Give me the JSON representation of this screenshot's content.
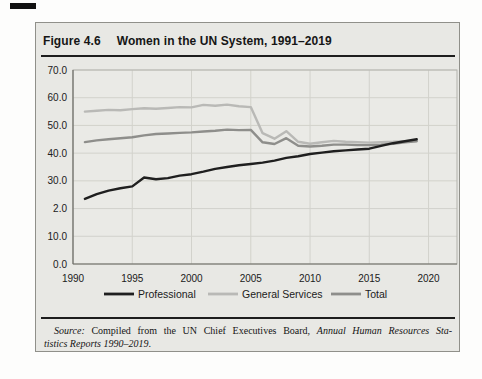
{
  "figure": {
    "label": "Figure 4.6",
    "title": "Women in the UN System, 1991–2019"
  },
  "source": {
    "label": "Source:",
    "text_after_label": " Compiled from the UN Chief Executives Board, ",
    "italic_line1": "Annual Human Resources Sta-",
    "italic_line2": "tistics Reports 1990–2019",
    "period": "."
  },
  "chart_data": {
    "type": "line",
    "x": [
      1991,
      1992,
      1993,
      1994,
      1995,
      1996,
      1997,
      1998,
      1999,
      2000,
      2001,
      2002,
      2003,
      2004,
      2005,
      2006,
      2007,
      2008,
      2009,
      2010,
      2011,
      2012,
      2013,
      2014,
      2015,
      2016,
      2017,
      2018,
      2019
    ],
    "series": [
      {
        "name": "Professional",
        "color": "#1f1f1f",
        "values": [
          23.5,
          25.2,
          26.5,
          27.3,
          28.0,
          31.2,
          30.6,
          31.0,
          31.9,
          32.4,
          33.3,
          34.3,
          35.0,
          35.6,
          36.1,
          36.6,
          37.3,
          38.3,
          38.9,
          39.7,
          40.2,
          40.7,
          41.0,
          41.3,
          41.6,
          42.6,
          43.6,
          44.3,
          45.0
        ]
      },
      {
        "name": "General Services",
        "color": "#b9b9b6",
        "values": [
          55.0,
          55.3,
          55.6,
          55.5,
          55.9,
          56.2,
          56.0,
          56.3,
          56.6,
          56.5,
          57.4,
          57.1,
          57.5,
          56.9,
          56.6,
          47.2,
          45.2,
          47.9,
          44.1,
          43.4,
          43.9,
          44.4,
          44.1,
          43.9,
          43.8,
          44.0,
          44.1,
          44.3,
          44.6
        ]
      },
      {
        "name": "Total",
        "color": "#8e8e8b",
        "values": [
          44.0,
          44.6,
          45.0,
          45.4,
          45.7,
          46.4,
          46.9,
          47.1,
          47.3,
          47.5,
          47.8,
          48.1,
          48.5,
          48.3,
          48.4,
          43.9,
          43.3,
          45.4,
          42.7,
          42.4,
          42.7,
          43.1,
          43.1,
          42.9,
          42.9,
          43.1,
          43.4,
          43.9,
          44.3
        ]
      }
    ],
    "xticks": [
      {
        "value": 1990,
        "label": "1990"
      },
      {
        "value": 1995,
        "label": "1995"
      },
      {
        "value": 2000,
        "label": "2000"
      },
      {
        "value": 2005,
        "label": "2005"
      },
      {
        "value": 2010,
        "label": "2010"
      },
      {
        "value": 2015,
        "label": "2015"
      },
      {
        "value": 2020,
        "label": "2020"
      }
    ],
    "yticks": [
      {
        "value": 70,
        "label": "70.0"
      },
      {
        "value": 60,
        "label": "60.0"
      },
      {
        "value": 50,
        "label": "50.0"
      },
      {
        "value": 40,
        "label": "40.0"
      },
      {
        "value": 30,
        "label": "30.0"
      },
      {
        "value": 20,
        "label": "2.0"
      },
      {
        "value": 10,
        "label": "10.0"
      },
      {
        "value": 0,
        "label": "0.0"
      }
    ],
    "xlim": [
      1990,
      2022.4
    ],
    "ylim": [
      0,
      70
    ],
    "grid": true,
    "legend_position": "bottom",
    "title": "Women in the UN System, 1991–2019",
    "xlabel": "",
    "ylabel": ""
  }
}
